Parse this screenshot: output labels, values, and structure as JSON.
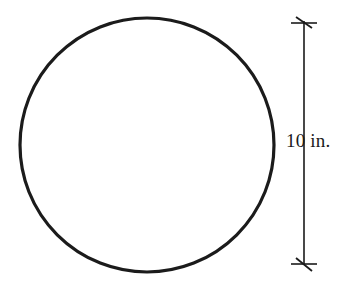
{
  "figure": {
    "kind": "geometry-diagram",
    "background_color": "#ffffff",
    "stroke_color": "#1b1b1b",
    "shape": {
      "name": "circle",
      "center_x": 147,
      "center_y": 145,
      "radius": 127,
      "stroke_width": 3.2,
      "fill": "none"
    },
    "dimension": {
      "label": "10 in.",
      "value": 10,
      "unit": "in.",
      "orientation": "vertical",
      "line_x": 304,
      "line_top_y": 21,
      "line_bottom_y": 265,
      "stroke_width": 1.6,
      "tick_style": "architectural-slash",
      "tick_half_width": 13,
      "tick_slash_length": 11,
      "label_x": 286,
      "label_y": 130,
      "label_font_size": 19,
      "label_color": "#1b1b1b"
    }
  }
}
